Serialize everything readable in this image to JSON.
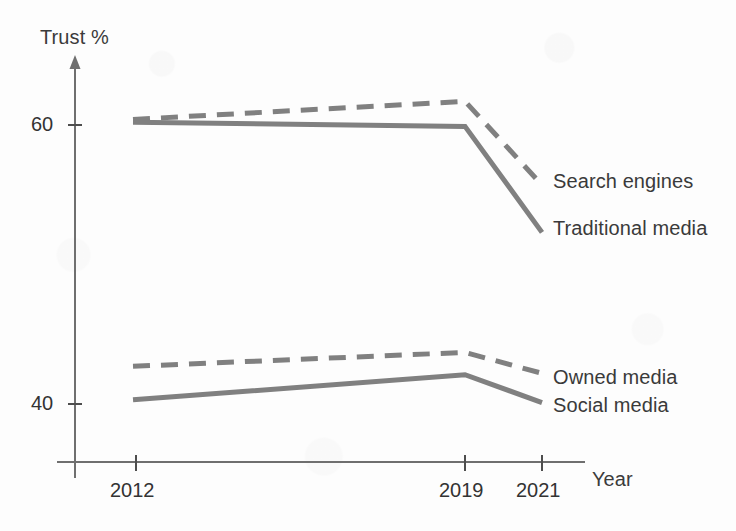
{
  "chart_data": {
    "type": "line",
    "title": "",
    "xlabel": "Year",
    "ylabel": "Trust %",
    "x": [
      2012,
      2019,
      2021
    ],
    "categories": [
      "2012",
      "2019",
      "2021"
    ],
    "xtick_labels": [
      "2012",
      "2019",
      "2021"
    ],
    "ytick_labels": [
      "60",
      "40"
    ],
    "yticks": [
      60,
      40
    ],
    "ylim": [
      36,
      66
    ],
    "xlim": [
      2010,
      2023
    ],
    "grid": false,
    "legend_position": "right-inline-end-of-line",
    "series": [
      {
        "name": "Search engines",
        "style": "dashed",
        "color": "#808080",
        "values": [
          60.4,
          61.7,
          55.7
        ]
      },
      {
        "name": "Traditional media",
        "style": "solid",
        "color": "#808080",
        "values": [
          60.2,
          59.9,
          52.3
        ]
      },
      {
        "name": "Owned media",
        "style": "dashed",
        "color": "#808080",
        "values": [
          42.7,
          43.7,
          42.2
        ]
      },
      {
        "name": "Social media",
        "style": "solid",
        "color": "#808080",
        "values": [
          40.3,
          42.1,
          40.1
        ]
      }
    ]
  },
  "axes": {
    "y_axis_title": "Trust %",
    "x_axis_title": "Year",
    "y_tick_60": "60",
    "y_tick_40": "40",
    "x_tick_2012": "2012",
    "x_tick_2019": "2019",
    "x_tick_2021": "2021",
    "axis_color": "#6f6f6f"
  },
  "series_labels": {
    "search_engines": "Search engines",
    "traditional_media": "Traditional media",
    "owned_media": "Owned media",
    "social_media": "Social media"
  },
  "colors": {
    "line": "#808080",
    "axis": "#6f6f6f",
    "text": "#3a3a3a",
    "background": "#fdfdfd"
  }
}
